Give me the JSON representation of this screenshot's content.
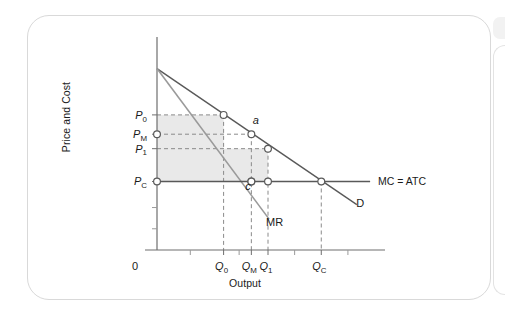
{
  "figure": {
    "axis_titles": {
      "y": "Price and Cost",
      "x": "Output"
    },
    "origin_label": "0"
  },
  "chart_data": {
    "type": "line",
    "title": "",
    "xlabel": "Output",
    "ylabel": "Price and Cost",
    "grid": false,
    "legend": "inline-annotations",
    "xlim": [
      0,
      10
    ],
    "ylim": [
      0,
      10
    ],
    "axis_ticks": {
      "x_labeled": [
        {
          "label": "Q0",
          "text": "Q",
          "sub": "0",
          "x": 3.0
        },
        {
          "label": "QM",
          "text": "Q",
          "sub": "M",
          "x": 4.25
        },
        {
          "label": "Q1",
          "text": "Q",
          "sub": "1",
          "x": 5.0
        },
        {
          "label": "QC",
          "text": "Q",
          "sub": "C",
          "x": 7.4
        }
      ],
      "x_minor": [
        1.5,
        3.7,
        6.2,
        8.6
      ],
      "y_labeled": [
        {
          "label": "P0",
          "text": "P",
          "sub": "0",
          "y": 7.0
        },
        {
          "label": "PM",
          "text": "P",
          "sub": "M",
          "y": 6.0
        },
        {
          "label": "P1",
          "text": "P",
          "sub": "1",
          "y": 5.25
        },
        {
          "label": "PC",
          "text": "P",
          "sub": "C",
          "y": 3.55
        }
      ],
      "y_minor": [
        2.2,
        1.1
      ]
    },
    "series": [
      {
        "name": "D",
        "label": "D",
        "role": "demand-curve",
        "color": "#595959",
        "points": [
          [
            0,
            9.4
          ],
          [
            9.0,
            2.35
          ]
        ]
      },
      {
        "name": "MR",
        "label": "MR",
        "role": "marginal-revenue-curve",
        "color": "#9a9a9a",
        "points": [
          [
            0,
            9.4
          ],
          [
            5.05,
            1.6
          ]
        ]
      },
      {
        "name": "MC = ATC",
        "label": "MC = ATC",
        "role": "marginal-and-average-total-cost",
        "color": "#595959",
        "points": [
          [
            0,
            3.55
          ],
          [
            9.6,
            3.55
          ]
        ]
      }
    ],
    "marked_points": [
      {
        "name": "P0-on-demand",
        "x": 3.0,
        "y": 7.0,
        "label": ""
      },
      {
        "name": "a",
        "x": 4.25,
        "y": 6.0,
        "label": "a"
      },
      {
        "name": "P1-on-demand",
        "x": 5.0,
        "y": 5.25,
        "label": ""
      },
      {
        "name": "c",
        "x": 4.25,
        "y": 3.55,
        "label": "c"
      },
      {
        "name": "Q1-on-MC",
        "x": 5.0,
        "y": 3.55,
        "label": ""
      },
      {
        "name": "QC-equilibrium",
        "x": 7.4,
        "y": 3.55,
        "label": ""
      },
      {
        "name": "PM-on-axis",
        "x": 0.0,
        "y": 6.0,
        "label": ""
      },
      {
        "name": "PC-on-axis",
        "x": 0.0,
        "y": 3.55,
        "label": ""
      },
      {
        "name": "MR-cross-MC",
        "x": 4.25,
        "y": 3.55,
        "label": ""
      }
    ],
    "shaded_regions": [
      {
        "name": "profit-rectangle-P0-Q0",
        "x0": 0,
        "x1": 3.0,
        "y0": 3.55,
        "y1": 7.0,
        "color": "#e9e9e9"
      },
      {
        "name": "profit-rectangle-P1-Q1",
        "x0": 0,
        "x1": 5.0,
        "y0": 3.55,
        "y1": 5.25,
        "color": "#e9e9e9"
      }
    ],
    "annotations": [
      {
        "name": "demand-label",
        "text": "D",
        "x": 9.15,
        "y": 2.25
      },
      {
        "name": "mr-label",
        "text": "MR",
        "x": 5.3,
        "y": 1.25
      },
      {
        "name": "mc-atc-label",
        "text": "MC = ATC",
        "x": 9.85,
        "y": 3.55
      },
      {
        "name": "point-a-label",
        "text": "a",
        "x": 4.45,
        "y": 6.55
      },
      {
        "name": "point-c-label",
        "text": "c",
        "x": 4.1,
        "y": 3.1
      }
    ]
  }
}
